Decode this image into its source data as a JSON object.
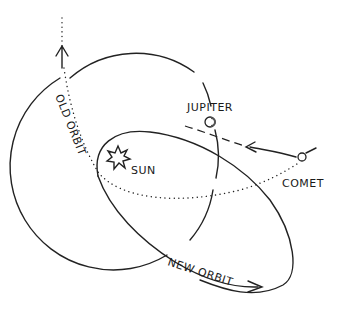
{
  "diagram": {
    "type": "orbital-diagram",
    "labels": {
      "jupiter": "JUPITER",
      "sun": "SUN",
      "comet": "COMET",
      "old_orbit": "OLD ORBIT",
      "new_orbit": "NEW ORBIT"
    },
    "elements": [
      {
        "id": "jupiter-orbit",
        "shape": "circle",
        "style": "solid"
      },
      {
        "id": "jupiter",
        "shape": "small-circle"
      },
      {
        "id": "sun",
        "shape": "star"
      },
      {
        "id": "comet",
        "shape": "small-circle"
      },
      {
        "id": "old-orbit",
        "shape": "path",
        "style": "dotted",
        "arrow": "up"
      },
      {
        "id": "new-orbit",
        "shape": "ellipse",
        "style": "solid",
        "arrow": "right"
      },
      {
        "id": "comet-approach",
        "shape": "path",
        "style": "dashed",
        "arrow": "left"
      }
    ],
    "colors": {
      "ink": "#222222",
      "background": "#ffffff"
    }
  }
}
